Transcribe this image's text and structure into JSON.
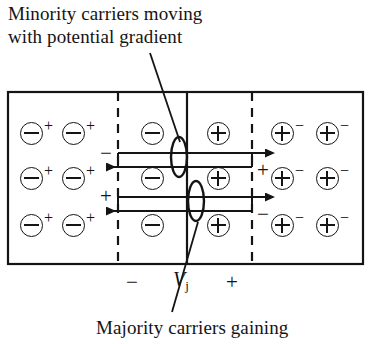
{
  "figure": {
    "width": 371,
    "height": 344,
    "background": "#ffffff",
    "ink_color": "#141414"
  },
  "annotations": {
    "top_caption_line1": "Minority carriers moving",
    "top_caption_line2": "with potential gradient",
    "bottom_caption": "Majority carriers gaining",
    "top_caption_full": "Minority carriers moving\nwith potential gradient"
  },
  "junction": {
    "voltage_label": "V",
    "voltage_subscript": "j",
    "left_polarity": "−",
    "right_polarity": "+",
    "depletion_left_sign": "−",
    "depletion_right_sign": "+",
    "inner_left_sign": "−",
    "inner_right_sign": "+"
  },
  "charges": {
    "p_region_core": "−",
    "p_region_superscript": "+",
    "n_region_core": "+",
    "n_region_superscript": "−",
    "depletion_left_core": "−",
    "depletion_right_core": "+",
    "rows": 3,
    "p_region_columns": 2,
    "n_region_columns": 2
  },
  "structure": {
    "outer_box": {
      "x": 8,
      "y": 92,
      "w": 355,
      "h": 172
    },
    "dashed_left_x": 118,
    "dashed_right_x": 252,
    "solid_center_x": 187,
    "row_y": [
      133,
      178,
      225
    ]
  },
  "arrows": {
    "minority_direction": "left",
    "majority_direction": "right",
    "minority_count": 2,
    "majority_count": 2
  }
}
